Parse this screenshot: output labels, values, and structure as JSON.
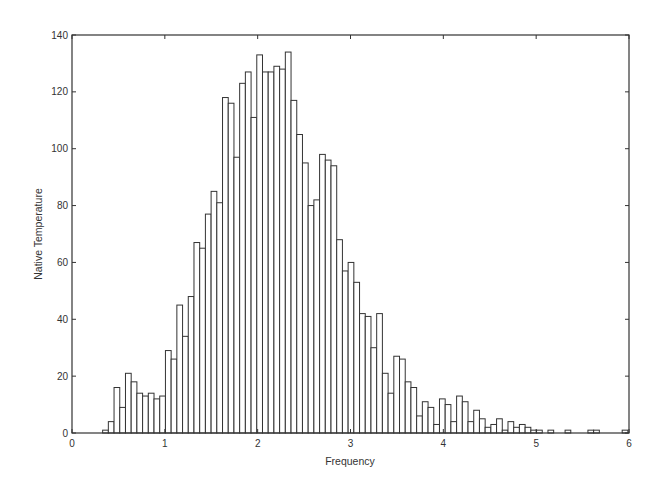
{
  "chart_data": {
    "type": "bar",
    "subtype": "histogram",
    "title": "",
    "xlabel": "Frequency",
    "ylabel": "Native Temperature",
    "xlim": [
      0,
      6
    ],
    "ylim": [
      0,
      140
    ],
    "xticks": [
      0,
      1,
      2,
      3,
      4,
      5,
      6
    ],
    "yticks": [
      0,
      20,
      40,
      60,
      80,
      100,
      120,
      140
    ],
    "grid": false,
    "legend": null,
    "bar_fill": "#ffffff",
    "bar_edge": "#333333",
    "bin_start": 0.33,
    "bin_width": 0.0615,
    "values": [
      1,
      4,
      16,
      9,
      21,
      18,
      14,
      13,
      14,
      12,
      13,
      29,
      26,
      45,
      34,
      48,
      67,
      65,
      77,
      85,
      81,
      118,
      116,
      97,
      123,
      127,
      111,
      133,
      127,
      127,
      129,
      128,
      134,
      117,
      105,
      95,
      80,
      82,
      98,
      96,
      94,
      68,
      57,
      60,
      53,
      42,
      41,
      30,
      42,
      21,
      14,
      27,
      26,
      18,
      16,
      6,
      11,
      9,
      3,
      12,
      10,
      4,
      13,
      11,
      4,
      8,
      5,
      2,
      3,
      5,
      1,
      4,
      2,
      3,
      2,
      1,
      1,
      0,
      1,
      0,
      0,
      1,
      0,
      0,
      0,
      1,
      1,
      0,
      0,
      0,
      0,
      1
    ]
  }
}
